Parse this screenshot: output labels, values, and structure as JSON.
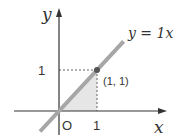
{
  "chart_data": {
    "type": "line",
    "title": "",
    "xlabel": "x",
    "ylabel": "y",
    "origin_label": "O",
    "x_ticks": [
      {
        "value": 1,
        "label": "1"
      }
    ],
    "y_ticks": [
      {
        "value": 1,
        "label": "1"
      }
    ],
    "xlim": [
      -0.5,
      2.8
    ],
    "ylim": [
      -0.55,
      2.4
    ],
    "series": [
      {
        "name": "y = 1x",
        "label": "y = 1x",
        "slope": 1,
        "intercept": 0,
        "x_range": [
          -0.5,
          1.7
        ],
        "color": "#a6a6a6"
      }
    ],
    "points": [
      {
        "x": 1,
        "y": 1,
        "label": "(1, 1)",
        "color": "#555555"
      }
    ],
    "shaded_region": {
      "description": "triangle under y=x from x=0 to x=1",
      "vertices": [
        [
          0,
          0
        ],
        [
          1,
          0
        ],
        [
          1,
          1
        ]
      ],
      "color": "#e6e6e6"
    },
    "guides": "dashed lines from (1,1) to each axis",
    "grid": false,
    "legend": "none"
  },
  "colors": {
    "axis": "#333333",
    "line": "#a6a6a6",
    "shade": "#e6e6e6",
    "point": "#555555",
    "dash": "#666666"
  }
}
